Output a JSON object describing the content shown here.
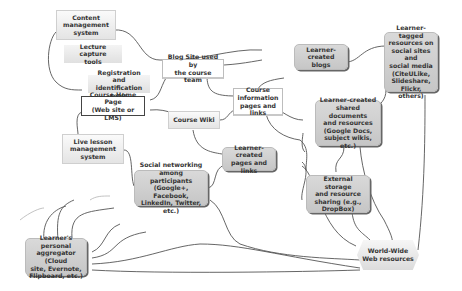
{
  "diagram": {
    "title": "",
    "nodes": {
      "cms": "Content management system",
      "lecture_capture": "Lecture capture tools",
      "registration": "Registration and identification tools",
      "course_home": "Course Home Page (Web site or LMS)",
      "blog_site": "Blog Site used by the course team",
      "learner_blogs": "Learner-created blogs",
      "learner_tagged": "Learner-tagged resources on social sites and social media (CiteULike, Slideshare, Flickr, others)",
      "course_info": "Course information pages and links",
      "course_wiki": "Course Wiki",
      "shared_docs": "Learner-created shared documents and resources (Google Docs, subject wikis, etc.)",
      "live_lesson": "Live lesson management system",
      "learner_pages": "Learner-created pages and links",
      "social_networking": "Social networking among participants (Google+, Facebook, LinkedIn, Twitter, etc.)",
      "external_storage": "External storage and resource sharing (e.g., DropBox)",
      "aggregator": "Learner's personal aggregator (Cloud site, Evernote, Flipboard, etc.)",
      "www": "World-Wide Web resources"
    },
    "node_lines": {
      "cms": [
        "Content",
        "management",
        "system"
      ],
      "lecture_capture": [
        "Lecture capture",
        "tools"
      ],
      "registration": [
        "Registration and",
        "identification tools"
      ],
      "course_home": [
        "Course Home Page",
        "(Web site or LMS)"
      ],
      "blog_site": [
        "Blog Site used by",
        "the course team"
      ],
      "learner_blogs": [
        "Learner-created",
        "blogs"
      ],
      "learner_tagged": [
        "Learner-tagged",
        "resources on",
        "social sites and",
        "social media",
        "(CiteULike,",
        "Slideshare, Flickr,",
        "others)"
      ],
      "course_info": [
        "Course",
        "information",
        "pages and links"
      ],
      "course_wiki": [
        "Course Wiki"
      ],
      "shared_docs": [
        "Learner-created",
        "shared documents",
        "and resources",
        "(Google Docs,",
        "subject wikis, etc.)"
      ],
      "live_lesson": [
        "Live lesson",
        "management",
        "system"
      ],
      "learner_pages": [
        "Learner-created",
        "pages and links"
      ],
      "social_networking": [
        "Social networking",
        "among participants",
        "(Google+, Facebook,",
        "LinkedIn, Twitter, etc.)"
      ],
      "external_storage": [
        "External storage",
        "and resource",
        "sharing (e.g.,",
        "DropBox)"
      ],
      "aggregator": [
        "Learner's personal",
        "aggregator (Cloud",
        "site, Evernote,",
        "Flipboard, etc.)"
      ],
      "www": [
        "World-Wide",
        "Web resources"
      ]
    },
    "edges": [
      [
        "cms",
        "learner_blogs"
      ],
      [
        "course_home",
        "cms"
      ],
      [
        "course_home",
        "blog_site"
      ],
      [
        "course_home",
        "course_wiki"
      ],
      [
        "course_home",
        "live_lesson"
      ],
      [
        "blog_site",
        "learner_blogs"
      ],
      [
        "blog_site",
        "course_info"
      ],
      [
        "course_info",
        "learner_blogs"
      ],
      [
        "course_info",
        "course_wiki"
      ],
      [
        "course_info",
        "shared_docs"
      ],
      [
        "course_info",
        "external_storage"
      ],
      [
        "learner_blogs",
        "learner_tagged"
      ],
      [
        "learner_tagged",
        "shared_docs"
      ],
      [
        "learner_tagged",
        "www"
      ],
      [
        "course_wiki",
        "learner_pages"
      ],
      [
        "learner_pages",
        "shared_docs"
      ],
      [
        "learner_pages",
        "social_networking"
      ],
      [
        "learner_pages",
        "external_storage"
      ],
      [
        "learner_pages",
        "www"
      ],
      [
        "shared_docs",
        "external_storage"
      ],
      [
        "shared_docs",
        "www"
      ],
      [
        "external_storage",
        "www"
      ],
      [
        "live_lesson",
        "social_networking"
      ],
      [
        "social_networking",
        "www"
      ],
      [
        "aggregator",
        "www"
      ]
    ]
  }
}
